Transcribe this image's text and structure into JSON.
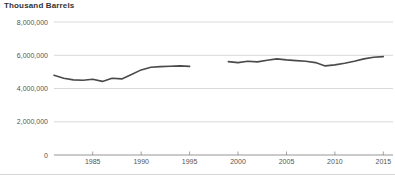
{
  "chart_data": {
    "type": "line",
    "title": "Thousand Barrels",
    "xlabel": "",
    "ylabel": "Thousand Barrels",
    "grid": true,
    "legend": "none",
    "xlim": [
      1981,
      2016
    ],
    "ylim": [
      0,
      8000000
    ],
    "y_ticks": [
      0,
      2000000,
      4000000,
      6000000,
      8000000
    ],
    "y_tick_labels": [
      "0",
      "2,000,000",
      "4,000,000",
      "6,000,000",
      "8,000,000"
    ],
    "x_ticks": [
      1985,
      1990,
      1995,
      2000,
      2005,
      2010,
      2015
    ],
    "x_tick_labels": [
      "1985",
      "1990",
      "1995",
      "2000",
      "2005",
      "2010",
      "2015"
    ],
    "series": [
      {
        "name": "segment-1",
        "x": [
          1981,
          1982,
          1983,
          1984,
          1985,
          1986,
          1987,
          1988,
          1989,
          1990,
          1991,
          1992,
          1993,
          1994,
          1995
        ],
        "values": [
          4800000,
          4620000,
          4520000,
          4500000,
          4560000,
          4430000,
          4620000,
          4580000,
          4840000,
          5120000,
          5280000,
          5320000,
          5340000,
          5360000,
          5330000
        ]
      },
      {
        "name": "segment-2",
        "x": [
          1999,
          2000,
          2001,
          2002,
          2003,
          2004,
          2005,
          2006,
          2007,
          2008,
          2009,
          2010,
          2011,
          2012,
          2013,
          2014,
          2015
        ],
        "values": [
          5620000,
          5560000,
          5640000,
          5600000,
          5700000,
          5780000,
          5720000,
          5680000,
          5640000,
          5560000,
          5360000,
          5420000,
          5520000,
          5640000,
          5780000,
          5880000,
          5920000
        ]
      }
    ]
  },
  "colors": {
    "line": "#4a4a4a",
    "grid": "#c9c9c9",
    "axis": "#8a8a8a",
    "text": "#555555",
    "title": "#333333"
  }
}
